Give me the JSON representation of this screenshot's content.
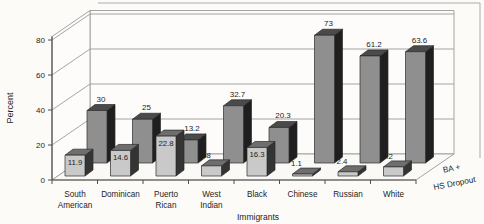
{
  "figure": {
    "background": "#fcfbf8"
  },
  "chart_data": {
    "type": "bar",
    "projection": "3d",
    "title": "",
    "xlabel": "Immigrants",
    "ylabel": "Percent",
    "categories": [
      "South American",
      "Dominican",
      "Puerto Rican",
      "West Indian",
      "Black",
      "Chinese",
      "Russian",
      "White"
    ],
    "series": [
      {
        "name": "HS Dropout",
        "depth": "front",
        "values": [
          11.9,
          14.6,
          22.8,
          5.8,
          16.3,
          1.1,
          2.4,
          5.2
        ],
        "face_color": "#c9c9c9",
        "top_color": "#6e6e6e",
        "side_color": "#343434"
      },
      {
        "name": "BA +",
        "depth": "back",
        "values": [
          30,
          25,
          13.2,
          32.7,
          20.3,
          73,
          61.2,
          63.6
        ],
        "face_color": "#8f8f8f",
        "top_color": "#4a4a4a",
        "side_color": "#1f1f1f"
      }
    ],
    "yticks": [
      0,
      20,
      40,
      60,
      80
    ],
    "ylim": [
      0,
      82
    ],
    "grid": true,
    "legend_position": "depth-axis-right",
    "colors": {
      "gridline": "#9b9b9b",
      "axis": "#4f4f4f",
      "outline": "#2b2b2b",
      "border": "#ababab",
      "text": "#1d1d1d",
      "wall_fill": "#fdfcfa",
      "floor_fill": "#faf9f6"
    }
  }
}
